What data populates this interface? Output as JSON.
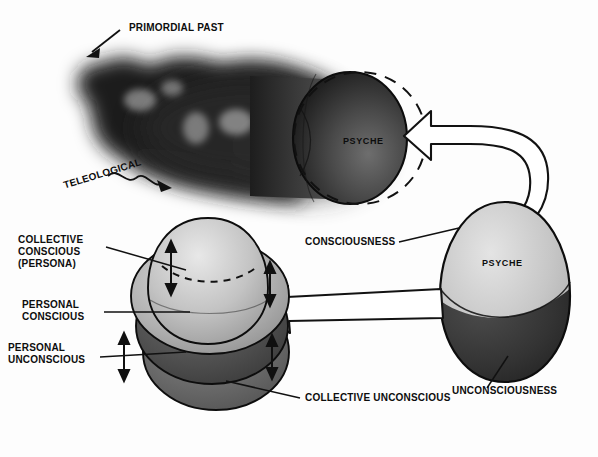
{
  "diagram": {
    "background_color": "#fdfdfd",
    "ink_color": "#0d0d0d"
  },
  "labels": {
    "primordial_past": "PRIMORDIAL PAST",
    "teleological": "TELEOLOGICAL",
    "psyche_cylinder": "PSYCHE",
    "psyche_egg": "PSYCHE",
    "consciousness": "CONSCIOUSNESS",
    "unconsciousness": "UNCONSCIOUSNESS",
    "collective_conscious_line1": "COLLECTIVE",
    "collective_conscious_line2": "CONSCIOUS",
    "collective_conscious_line3": "(PERSONA)",
    "personal_conscious_line1": "PERSONAL",
    "personal_conscious_line2": "CONSCIOUS",
    "personal_unconscious_line1": "PERSONAL",
    "personal_unconscious_line2": "UNCONSCIOUS",
    "collective_unconscious": "COLLECTIVE UNCONSCIOUS"
  },
  "shapes": {
    "smoke_cloud": "primordial-smoke-mass",
    "cylinder": "psyche-cylinder",
    "dashed_circle": "psyche-dashed-outline",
    "right_egg": "psyche-egg-right",
    "left_stack": "psyche-layer-stack-left"
  },
  "stack_layers": [
    {
      "name": "collective-conscious-persona",
      "tone": "#b9b9b9"
    },
    {
      "name": "personal-conscious",
      "tone": "#9e9e9e"
    },
    {
      "name": "personal-unconscious",
      "tone": "#4a4a4a"
    },
    {
      "name": "collective-unconscious",
      "tone": "#6b6b6b"
    }
  ],
  "arrows": {
    "curved_double": "curved-double-headed-block-arrow",
    "straight_block": "straight-block-arrow-left",
    "teleological_squiggle": "teleological-squiggle-arrow",
    "primordial_pointer": "primordial-past-pointer-arrow",
    "stack_double_arrows": "double-headed-permeability-arrows"
  },
  "colors": {
    "egg_light": "#c9c9c9",
    "egg_dark": "#2e2e2e",
    "cylinder_dark": "#2b2b2b",
    "outline": "#111111"
  }
}
